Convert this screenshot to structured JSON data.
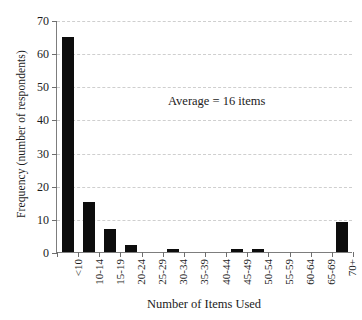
{
  "chart_data": {
    "type": "bar",
    "title": "",
    "xlabel": "Number of Items Used",
    "ylabel": "Frequency (number of respondents)",
    "categories": [
      "<10",
      "10-14",
      "15-19",
      "20-24",
      "25-29",
      "30-34",
      "35-39",
      "40-44",
      "45-49",
      "50-54",
      "55-59",
      "60-64",
      "65-69",
      "70+"
    ],
    "values": [
      65,
      15,
      7,
      2,
      0,
      1,
      0,
      0,
      1,
      1,
      0,
      0,
      0,
      9
    ],
    "ylim": [
      0,
      70
    ],
    "yticks": [
      0,
      10,
      20,
      30,
      40,
      50,
      60,
      70
    ],
    "ytick_labels": [
      "0",
      "10",
      "20",
      "30",
      "40",
      "50",
      "60",
      "70"
    ],
    "grid": "horizontal-dashed",
    "legend": "none",
    "annotations": [
      {
        "text": "Average = 16 items",
        "x_category": "30-34",
        "y_value": 47
      }
    ],
    "bar_color": "#0d0d0d",
    "gridline_color": "#cfcfcf",
    "axis_color": "#7d7d7d"
  }
}
